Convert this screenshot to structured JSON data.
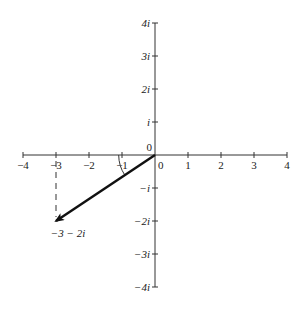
{
  "diagram": {
    "origin_px": [
      155,
      155
    ],
    "unit_px": 33,
    "colors": {
      "axis": "#333333",
      "vector": "#111111",
      "text": "#222222",
      "background": "#ffffff"
    },
    "origin_labels": {
      "above": "0",
      "below": "0"
    },
    "real_axis": {
      "range": [
        -4,
        4
      ],
      "ticks": [
        {
          "value": -4,
          "label": "−4"
        },
        {
          "value": -3,
          "label": "−3"
        },
        {
          "value": -2,
          "label": "−2"
        },
        {
          "value": -1,
          "label": "−1"
        },
        {
          "value": 1,
          "label": "1"
        },
        {
          "value": 2,
          "label": "2"
        },
        {
          "value": 3,
          "label": "3"
        },
        {
          "value": 4,
          "label": "4"
        }
      ]
    },
    "imaginary_axis": {
      "range": [
        -4,
        4
      ],
      "ticks": [
        {
          "value": 4,
          "label": "4i"
        },
        {
          "value": 3,
          "label": "3i"
        },
        {
          "value": 2,
          "label": "2i"
        },
        {
          "value": 1,
          "label": "i"
        },
        {
          "value": -1,
          "label": "−i"
        },
        {
          "value": -2,
          "label": "−2i"
        },
        {
          "value": -3,
          "label": "−3i"
        },
        {
          "value": -4,
          "label": "−4i"
        }
      ]
    },
    "vector": {
      "from": [
        0,
        0
      ],
      "to": [
        -3,
        -2
      ],
      "label": "−3 − 2i",
      "style": "thick solid arrow"
    },
    "projection": {
      "from": [
        -3,
        0
      ],
      "to": [
        -3,
        -2
      ],
      "style": "dashed"
    },
    "angle_arc": {
      "between": [
        "negative real axis",
        "vector"
      ],
      "radius_units": 1.1
    }
  }
}
